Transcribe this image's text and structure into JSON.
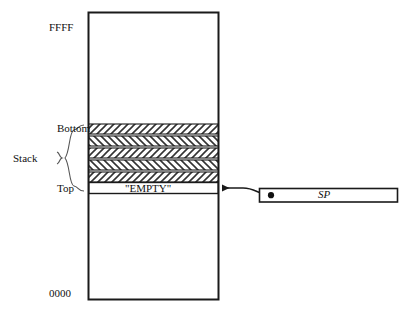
{
  "figure": {
    "type": "memory-map-diagram"
  },
  "memory": {
    "top_address": "FFFF",
    "bottom_address": "0000",
    "empty_cell_label": "\"EMPTY\"",
    "box": {
      "x": 88,
      "y": 12,
      "width": 131,
      "height": 288
    }
  },
  "stack": {
    "brace_label": "Stack",
    "top_marker_label": "Bottom",
    "bottom_marker_label": "Top",
    "filled_bands": 5,
    "band_region": {
      "y_start": 124,
      "y_end": 182
    },
    "empty_row": {
      "y_start": 182,
      "y_end": 194
    }
  },
  "pointer": {
    "register_label": "SP",
    "box": {
      "x": 259,
      "y": 188,
      "width": 139,
      "height": 14
    },
    "dot_x": 271,
    "dot_y": 195,
    "arrow_tip_x": 219,
    "arrow_tip_y": 188
  },
  "colors": {
    "stroke": "#1a1a1a",
    "hatch": "#333333",
    "background": "#ffffff",
    "text": "#111111"
  }
}
